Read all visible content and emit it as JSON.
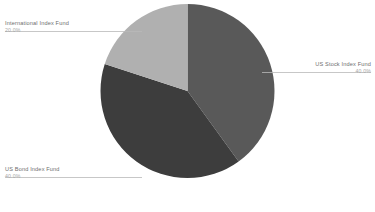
{
  "chart_data": {
    "type": "pie",
    "title": "",
    "subtitle": "",
    "xlabel": "",
    "ylabel": "",
    "grid": false,
    "legend_position": "callout-labels",
    "start_angle_deg": 0,
    "direction": "clockwise",
    "categories": [
      "US Stock Index Fund",
      "US Bond Index Fund",
      "International Index Fund"
    ],
    "values": [
      40.0,
      40.0,
      20.0
    ],
    "value_unit": "percent",
    "slices": [
      {
        "label": "US Stock Index Fund",
        "value": 40.0,
        "value_text": "40.0%",
        "color": "#595959",
        "start_deg": 0,
        "end_deg": 144,
        "callout_side": "right"
      },
      {
        "label": "US Bond Index Fund",
        "value": 40.0,
        "value_text": "40.0%",
        "color": "#3d3d3d",
        "start_deg": 144,
        "end_deg": 288,
        "callout_side": "left"
      },
      {
        "label": "International Index Fund",
        "value": 20.0,
        "value_text": "20.0%",
        "color": "#b0b0b0",
        "start_deg": 288,
        "end_deg": 360,
        "callout_side": "left"
      }
    ]
  },
  "callouts": {
    "international": {
      "name": "International Index Fund",
      "value": "20.0%"
    },
    "us_bond": {
      "name": "US Bond Index Fund",
      "value": "40.0%"
    },
    "us_stock": {
      "name": "US Stock Index Fund",
      "value": "40.0%"
    }
  },
  "colors": {
    "background": "#ffffff",
    "us_stock_slice": "#595959",
    "us_bond_slice": "#3d3d3d",
    "international_slice": "#b0b0b0",
    "leader_line": "#b9b9b9",
    "label_text": "#6e6e6e",
    "value_text": "#a8a8a8"
  }
}
